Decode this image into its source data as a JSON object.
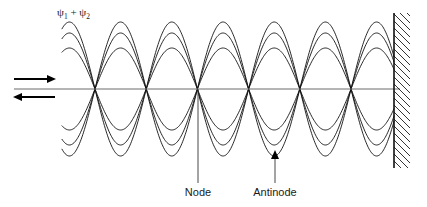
{
  "figure": {
    "background_color": "#ffffff",
    "width": 427,
    "height": 207
  },
  "labels": {
    "psi_main": "ψ",
    "psi_sub_1": "1",
    "psi_plus": "+",
    "psi_sub_2": "2",
    "psi_full": "ψ₁ + ψ₂",
    "node": "Node",
    "antinode": "Antinode"
  },
  "colors": {
    "curve": "#111111",
    "axis": "#6b6b6b",
    "wall": "#111111",
    "hatch": "#111111",
    "leader": "#333333",
    "arrow": "#000000",
    "text": "#1a1a1a"
  },
  "chart_data": {
    "type": "line",
    "xlabel": "",
    "ylabel": "",
    "axis_y": 89,
    "x_start": 62,
    "x_end": 394,
    "node_spacing": 51.2,
    "node_positions": [
      95,
      146,
      198,
      249,
      301,
      352,
      394
    ],
    "node_count": 7,
    "amplitudes": [
      67,
      56,
      41
    ],
    "amplitude_count": 3,
    "envelope_description": "Three superposed standing-wave snapshots of decreasing amplitude; each drawn as a full sinusoid with positive and negative lobes sharing common nodes.",
    "half_wavelength_px": 51.2,
    "grid": false,
    "legend": false,
    "annotations": [
      {
        "text": "Node",
        "points_to_x": 198,
        "points_to_y": 89,
        "label_x": 198,
        "label_y": 196,
        "marker": "leader-line"
      },
      {
        "text": "Antinode",
        "points_to_x": 275,
        "points_to_y": 152,
        "label_x": 275,
        "label_y": 196,
        "marker": "arrow-up"
      },
      {
        "text": "ψ₁ + ψ₂",
        "label_x": 58,
        "label_y": 15,
        "marker": "none"
      }
    ]
  },
  "wall": {
    "name": "reflecting-wall",
    "x": 394,
    "top": 13,
    "bottom": 168,
    "hatch_width": 16,
    "hatch_count": 22,
    "hatch_direction": "diagonal-down-right"
  },
  "incident_arrow": {
    "name": "incident-wave-arrow",
    "direction": "right",
    "x1": 14,
    "x2": 55,
    "y": 79
  },
  "reflected_arrow": {
    "name": "reflected-wave-arrow",
    "direction": "left",
    "x1": 55,
    "x2": 14,
    "y": 97
  }
}
